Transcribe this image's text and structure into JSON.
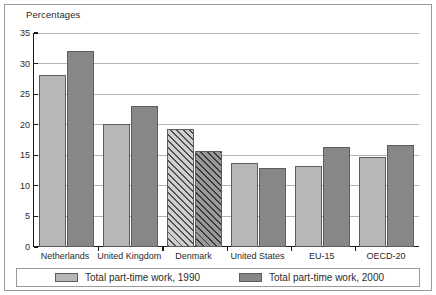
{
  "chart_data": {
    "type": "bar",
    "title": "Percentages",
    "xlabel": "",
    "ylabel": "",
    "ylim": [
      0,
      35
    ],
    "ytick_step": 5,
    "yticks": [
      "0",
      "5",
      "10",
      "15",
      "20",
      "25",
      "30",
      "35"
    ],
    "grid": true,
    "legend_position": "bottom",
    "categories": [
      "Netherlands",
      "United Kingdom",
      "Denmark",
      "United States",
      "EU-15",
      "OECD-20"
    ],
    "series": [
      {
        "name": "Total part-time work, 1990",
        "color": "#b7b7b7",
        "values": [
          28.2,
          20.2,
          19.3,
          13.7,
          13.3,
          14.8
        ]
      },
      {
        "name": "Total part-time work, 2000",
        "color": "#878787",
        "values": [
          32.1,
          23.0,
          15.7,
          13.0,
          16.3,
          16.7
        ]
      }
    ],
    "highlighted_category": "Denmark",
    "highlight_style": "diagonal-hatch"
  },
  "legend": {
    "entries": [
      {
        "label": "Total part-time work, 1990",
        "swatch": "s1990"
      },
      {
        "label": "Total part-time work, 2000",
        "swatch": "s2000"
      }
    ]
  }
}
